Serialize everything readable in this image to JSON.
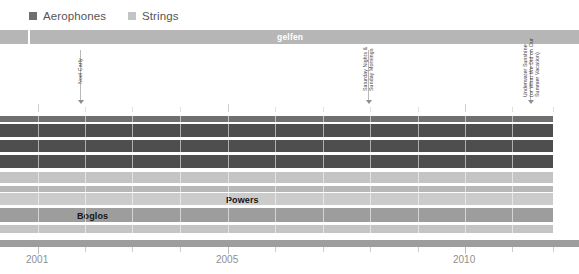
{
  "legend": {
    "items": [
      {
        "label": "Aerophones",
        "color": "#6f6f6f",
        "swatch_name": "legend-swatch-aerophones"
      },
      {
        "label": "Strings",
        "color": "#c4c4c4",
        "swatch_name": "legend-swatch-strings"
      }
    ]
  },
  "topbar": {
    "label": "gelfen",
    "segments": [
      {
        "x": 0,
        "width": 28,
        "color": "#b6b6b6"
      },
      {
        "x": 30,
        "width": 549,
        "color": "#b6b6b6"
      }
    ],
    "label_x": 277
  },
  "annotations": [
    {
      "name": "annotation-noel-carly",
      "x": 80,
      "lines": [
        "Noel Carly"
      ],
      "line_top": 50,
      "line_height": 50,
      "arrow_top": 100,
      "text_x": 77,
      "text_y": 84
    },
    {
      "name": "annotation-sunday-nights",
      "x": 368,
      "lines": [
        "Saturday Nights &",
        "Sunday Mornings"
      ],
      "line_top": 50,
      "line_height": 50,
      "arrow_top": 100,
      "text_x": 362,
      "text_y": 91
    },
    {
      "name": "annotation-underwater-sunshine",
      "x": 530,
      "lines": [
        "Underwater Sunshine",
        "(or What We Did on Our",
        "Summer Vacation)"
      ],
      "line_top": 50,
      "line_height": 50,
      "arrow_top": 100,
      "text_x": 522,
      "text_y": 97
    }
  ],
  "axis": {
    "labels": [
      {
        "text": "2001",
        "x": 26
      },
      {
        "text": "2005",
        "x": 216
      },
      {
        "text": "2010",
        "x": 453
      }
    ],
    "major_ticks": [
      38,
      228,
      465
    ],
    "minor_ticks": [
      85,
      132,
      180,
      275,
      323,
      370,
      418,
      512,
      553
    ]
  },
  "chart_data": {
    "type": "bar",
    "orientation": "horizontal",
    "title": "",
    "xlabel": "",
    "ylabel": "",
    "xlim": [
      2000.7,
      2012.6
    ],
    "grid": true,
    "legend_position": "top-left",
    "categories": [
      "Aerophones",
      "Strings"
    ],
    "series": [
      {
        "name": "Aerophones",
        "color": "#6f6f6f"
      },
      {
        "name": "Strings",
        "color": "#c4c4c4"
      }
    ],
    "bands": [
      {
        "name": "band-1",
        "y": 2,
        "height": 6,
        "x": 0,
        "width": 553,
        "color": "#6f6f6f",
        "label": ""
      },
      {
        "name": "band-2",
        "y": 10,
        "height": 13,
        "x": 0,
        "width": 553,
        "color": "#4e4e4e",
        "label": ""
      },
      {
        "name": "band-3",
        "y": 26,
        "height": 12,
        "x": 0,
        "width": 553,
        "color": "#4e4e4e",
        "label": ""
      },
      {
        "name": "band-4",
        "y": 41,
        "height": 13,
        "x": 0,
        "width": 553,
        "color": "#4e4e4e",
        "label": ""
      },
      {
        "name": "band-5",
        "y": 58,
        "height": 11,
        "x": 0,
        "width": 553,
        "color": "#c4c4c4",
        "label": ""
      },
      {
        "name": "band-6",
        "y": 72,
        "height": 6,
        "x": 0,
        "width": 553,
        "color": "#b8b8b8",
        "label": ""
      },
      {
        "name": "band-7",
        "y": 79,
        "height": 12,
        "x": 0,
        "width": 553,
        "color": "#cbcbcb",
        "label": "Powers",
        "label_x": 226,
        "label_y": 81
      },
      {
        "name": "band-8",
        "y": 94,
        "height": 14,
        "x": 0,
        "width": 553,
        "color": "#9d9d9d",
        "label": "Boglos",
        "label_x": 77,
        "label_y": 97
      },
      {
        "name": "band-9",
        "y": 111,
        "height": 8,
        "x": 0,
        "width": 553,
        "color": "#c4c4c4",
        "label": ""
      }
    ],
    "gridlines": [
      38,
      85,
      132,
      180,
      228,
      275,
      323,
      370,
      418,
      465,
      512,
      553
    ]
  }
}
